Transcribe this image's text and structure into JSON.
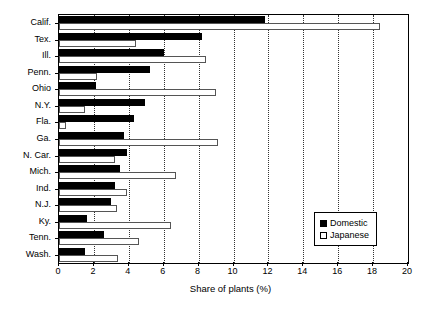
{
  "chart_data": {
    "type": "bar",
    "orientation": "horizontal",
    "title": "",
    "xlabel": "Share of plants (%)",
    "ylabel": "",
    "xlim": [
      0,
      20
    ],
    "xticks": [
      0,
      2,
      4,
      6,
      8,
      10,
      12,
      14,
      16,
      18,
      20
    ],
    "xtick_labels": [
      "0",
      "2",
      "4",
      "6",
      "8",
      "10",
      "12",
      "14",
      "16",
      "18",
      "20"
    ],
    "grid": "vertical dotted gridlines at every x tick",
    "legend_position": "inside lower right",
    "categories": [
      "Calif.",
      "Tex.",
      "Ill.",
      "Penn.",
      "Ohio",
      "N.Y.",
      "Fla.",
      "Ga.",
      "N. Car.",
      "Mich.",
      "Ind.",
      "N.J.",
      "Ky.",
      "Tenn.",
      "Wash."
    ],
    "series": [
      {
        "name": "Domestic",
        "color": "#000000",
        "values": [
          11.8,
          8.2,
          6.0,
          5.2,
          2.1,
          4.9,
          4.3,
          3.7,
          3.9,
          3.5,
          3.2,
          3.0,
          1.6,
          2.6,
          1.5
        ]
      },
      {
        "name": "Japanese",
        "color": "#ffffff",
        "values": [
          18.4,
          4.4,
          8.4,
          2.2,
          9.0,
          1.5,
          0.4,
          9.1,
          3.2,
          6.7,
          3.9,
          3.3,
          6.4,
          4.6,
          3.4
        ]
      }
    ]
  },
  "legend": {
    "entries": [
      {
        "label": "Domestic",
        "swatch": "filled-black-square"
      },
      {
        "label": "Japanese",
        "swatch": "open-white-square"
      }
    ]
  }
}
